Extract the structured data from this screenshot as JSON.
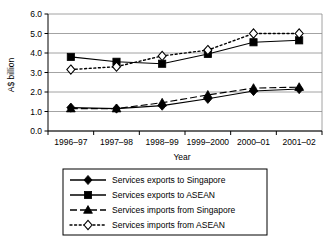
{
  "chart_data": {
    "type": "line",
    "title": "",
    "xlabel": "Year",
    "ylabel": "A$ billion",
    "categories": [
      "1996–97",
      "1997–98",
      "1998–99",
      "1999–2000",
      "2000–01",
      "2001–02"
    ],
    "ylim": [
      0.0,
      6.0
    ],
    "yticks": [
      "0.0",
      "1.0",
      "2.0",
      "3.0",
      "4.0",
      "5.0",
      "6.0"
    ],
    "ytick_values": [
      0.0,
      1.0,
      2.0,
      3.0,
      4.0,
      5.0,
      6.0
    ],
    "grid": "horizontal",
    "legend_position": "bottom",
    "series": [
      {
        "name": "Services exports to Singapore",
        "marker": "filled-diamond",
        "line_style": "solid",
        "color": "#000000",
        "values": [
          1.2,
          1.15,
          1.3,
          1.65,
          2.05,
          2.15
        ]
      },
      {
        "name": "Services exports to ASEAN",
        "marker": "filled-square",
        "line_style": "solid",
        "color": "#000000",
        "values": [
          3.8,
          3.55,
          3.45,
          3.95,
          4.55,
          4.65
        ]
      },
      {
        "name": "Services imports from Singapore",
        "marker": "filled-triangle",
        "line_style": "dashed",
        "color": "#000000",
        "values": [
          1.15,
          1.15,
          1.45,
          1.85,
          2.2,
          2.25
        ]
      },
      {
        "name": "Services imports from ASEAN",
        "marker": "open-diamond",
        "line_style": "dotted",
        "color": "#000000",
        "values": [
          3.15,
          3.3,
          3.85,
          4.15,
          5.0,
          5.0
        ]
      }
    ]
  }
}
